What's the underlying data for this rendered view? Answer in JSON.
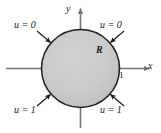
{
  "figure": {
    "type": "math-diagram",
    "colors": {
      "background": "#ffffff",
      "disk_fill": "#c9c9c9",
      "disk_stroke": "#1a1a1a",
      "axis": "#6e6e6e",
      "text": "#1a1a1a",
      "arrow": "#1a1a1a"
    },
    "axes": {
      "x_label": "x",
      "y_label": "y",
      "origin": {
        "x": 80,
        "y": 68
      },
      "x_line": {
        "x1": 6,
        "x2": 146,
        "y": 68
      },
      "y_line": {
        "x": 80,
        "y1": 10,
        "y2": 128
      }
    },
    "region": {
      "label": "R",
      "shape": "circle",
      "center": {
        "x": 80,
        "y": 68
      },
      "radius": 39
    },
    "ticks": [
      {
        "label": "1",
        "axis": "x",
        "value": 1
      }
    ],
    "boundary_conditions": [
      {
        "id": "top-left",
        "label": "u = 0",
        "value": 0
      },
      {
        "id": "top-right",
        "label": "u = 0",
        "value": 0
      },
      {
        "id": "bottom-left",
        "label": "u = 1",
        "value": 1
      },
      {
        "id": "bottom-right",
        "label": "u = 1",
        "value": 1
      }
    ],
    "leader_arrows": [
      {
        "id": "arrow-top-left",
        "x1": 38,
        "y1": 30,
        "x2": 50,
        "y2": 41
      },
      {
        "id": "arrow-top-right",
        "x1": 122,
        "y1": 30,
        "x2": 110,
        "y2": 41
      },
      {
        "id": "arrow-bottom-left",
        "x1": 38,
        "y1": 106,
        "x2": 50,
        "y2": 95
      },
      {
        "id": "arrow-bottom-right",
        "x1": 122,
        "y1": 106,
        "x2": 110,
        "y2": 95
      }
    ]
  }
}
